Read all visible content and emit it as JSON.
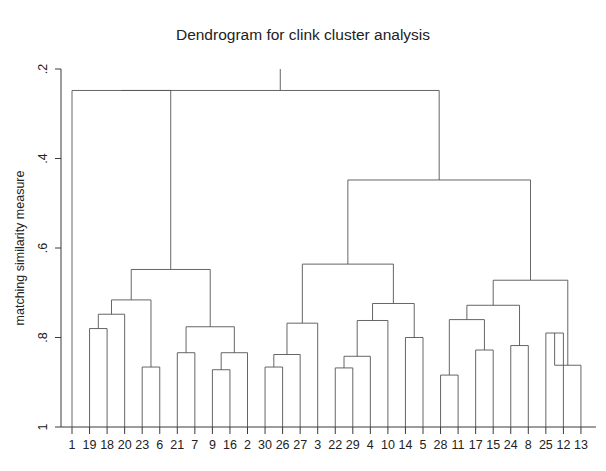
{
  "chart_data": {
    "type": "line",
    "title": "Dendrogram for clink cluster analysis",
    "xlabel": "",
    "ylabel": "matching similarity measure",
    "yticks": [
      0.2,
      0.4,
      0.6,
      0.8,
      1.0
    ],
    "ytick_labels": [
      ".2",
      ".4",
      ".6",
      ".8",
      "1"
    ],
    "ylim": [
      0.2,
      1.0
    ],
    "y_inverted": true,
    "grid": false,
    "legend": null,
    "leaf_labels": [
      "1",
      "19",
      "18",
      "20",
      "23",
      "6",
      "21",
      "7",
      "9",
      "16",
      "2",
      "30",
      "26",
      "27",
      "3",
      "22",
      "29",
      "4",
      "10",
      "14",
      "5",
      "28",
      "11",
      "17",
      "15",
      "24",
      "8",
      "25",
      "12",
      "13"
    ],
    "leaf_count": 30,
    "leaf_base_value": 1.0,
    "merges": [
      {
        "id": "m1",
        "left": {
          "leaf": 1
        },
        "right": {
          "leaf": 2
        },
        "height": 0.78
      },
      {
        "id": "m2",
        "left": {
          "node": "m1"
        },
        "right": {
          "leaf": 3
        },
        "height": 0.748
      },
      {
        "id": "m3",
        "left": {
          "leaf": 4
        },
        "right": {
          "leaf": 5
        },
        "height": 0.866
      },
      {
        "id": "m4",
        "left": {
          "node": "m2"
        },
        "right": {
          "node": "m3"
        },
        "height": 0.716
      },
      {
        "id": "m5",
        "left": {
          "leaf": 6
        },
        "right": {
          "leaf": 7
        },
        "height": 0.834
      },
      {
        "id": "m6",
        "left": {
          "leaf": 8
        },
        "right": {
          "leaf": 9
        },
        "height": 0.872
      },
      {
        "id": "m7",
        "left": {
          "node": "m6"
        },
        "right": {
          "leaf": 10
        },
        "height": 0.834
      },
      {
        "id": "m8",
        "left": {
          "node": "m5"
        },
        "right": {
          "node": "m7"
        },
        "height": 0.776
      },
      {
        "id": "m9",
        "left": {
          "node": "m4"
        },
        "right": {
          "node": "m8"
        },
        "height": 0.648
      },
      {
        "id": "m10",
        "left": {
          "leaf": 0
        },
        "right": {
          "node": "m9"
        },
        "height": 0.248
      },
      {
        "id": "m11",
        "left": {
          "leaf": 11
        },
        "right": {
          "leaf": 12
        },
        "height": 0.866
      },
      {
        "id": "m12",
        "left": {
          "node": "m11"
        },
        "right": {
          "leaf": 13
        },
        "height": 0.838
      },
      {
        "id": "m13",
        "left": {
          "node": "m12"
        },
        "right": {
          "leaf": 14
        },
        "height": 0.768
      },
      {
        "id": "m14",
        "left": {
          "leaf": 15
        },
        "right": {
          "leaf": 16
        },
        "height": 0.868
      },
      {
        "id": "m15",
        "left": {
          "node": "m14"
        },
        "right": {
          "leaf": 17
        },
        "height": 0.842
      },
      {
        "id": "m16",
        "left": {
          "node": "m15"
        },
        "right": {
          "leaf": 18
        },
        "height": 0.762
      },
      {
        "id": "m17",
        "left": {
          "leaf": 19
        },
        "right": {
          "leaf": 20
        },
        "height": 0.8
      },
      {
        "id": "m18",
        "left": {
          "node": "m16"
        },
        "right": {
          "node": "m17"
        },
        "height": 0.724
      },
      {
        "id": "m19",
        "left": {
          "node": "m13"
        },
        "right": {
          "node": "m18"
        },
        "height": 0.636
      },
      {
        "id": "m20",
        "left": {
          "leaf": 21
        },
        "right": {
          "leaf": 22
        },
        "height": 0.884
      },
      {
        "id": "m21",
        "left": {
          "leaf": 23
        },
        "right": {
          "leaf": 24
        },
        "height": 0.828
      },
      {
        "id": "m22",
        "left": {
          "node": "m20"
        },
        "right": {
          "node": "m21"
        },
        "height": 0.76
      },
      {
        "id": "m23",
        "left": {
          "leaf": 25
        },
        "right": {
          "leaf": 26
        },
        "height": 0.818
      },
      {
        "id": "m24",
        "left": {
          "node": "m22"
        },
        "right": {
          "node": "m23"
        },
        "height": 0.728
      },
      {
        "id": "m25",
        "left": {
          "leaf": 27
        },
        "right": {
          "leaf": 28
        },
        "height": 0.79
      },
      {
        "id": "m26",
        "left": {
          "node": "m25"
        },
        "right": {
          "leaf": 29
        },
        "height": 0.862
      },
      {
        "id": "m27",
        "left": {
          "node": "m24"
        },
        "right": {
          "node": "m26"
        },
        "height": 0.672
      },
      {
        "id": "m28",
        "left": {
          "node": "m19"
        },
        "right": {
          "node": "m27"
        },
        "height": 0.448
      },
      {
        "id": "m29",
        "left": {
          "node": "m10"
        },
        "right": {
          "node": "m28"
        },
        "height": 0.248
      }
    ],
    "root": "m29"
  },
  "figure": {
    "title": "Dendrogram for clink cluster analysis",
    "ylabel": "matching similarity measure"
  }
}
